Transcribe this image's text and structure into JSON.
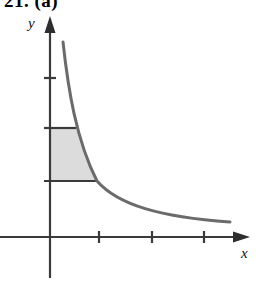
{
  "figure": {
    "caption": "21. (a)",
    "background_color": "#ffffff",
    "width": 256,
    "height": 300
  },
  "axes": {
    "x_label": "x",
    "y_label": "y",
    "axis_color": "#3a3a3a",
    "x_axis_y": 237,
    "y_axis_x": 50,
    "x_axis_start_x": 0,
    "x_axis_arrow_tip_x": 250,
    "y_axis_arrow_tip_y": 16,
    "y_axis_bottom_y": 278,
    "x_label_pos": {
      "x": 241,
      "y": 258
    },
    "y_label_pos": {
      "x": 28,
      "y": 28
    },
    "x_ticks": [
      99,
      152,
      204
    ],
    "y_ticks": [
      78,
      128,
      181
    ],
    "tick_half_length": 6
  },
  "curve": {
    "name": "reciprocal-curve",
    "color": "#6b6b6b",
    "stroke_width": 3,
    "path": "M 63 42 C 68 88, 76 140, 97 181 C 118 205, 160 217, 230 222"
  },
  "shaded_region": {
    "name": "shaded-area",
    "fill_color": "#dcdcdc",
    "edge_color": "#3a3a3a",
    "top_y": 128,
    "bottom_y": 181,
    "left_x": 50,
    "right_x_top": 76,
    "right_x_bottom": 97,
    "path": "M 50 128 L 76 128 C 80 144, 86 165, 97 181 L 50 181 Z",
    "top_edge_path": "M 44 128 L 76 128",
    "bottom_edge_path": "M 44 181 L 97 181"
  },
  "chart_data": {
    "type": "line",
    "title": "21. (a)",
    "xlabel": "x",
    "ylabel": "y",
    "grid": false,
    "legend": null,
    "series": [
      {
        "name": "y = 1/x",
        "x": [
          0.5,
          0.75,
          1.0,
          1.5,
          2.0,
          2.5,
          3.0,
          3.5,
          4.0
        ],
        "y": [
          4.0,
          2.67,
          2.0,
          1.33,
          1.0,
          0.8,
          0.67,
          0.57,
          0.5
        ]
      }
    ],
    "annotations": [
      {
        "type": "shaded-region",
        "label": "area under curve",
        "x_range": [
          0,
          1
        ],
        "y_range": [
          1,
          2
        ],
        "fill": "#dcdcdc"
      }
    ],
    "xlim": [
      0,
      4.3
    ],
    "ylim": [
      0,
      4.6
    ],
    "x_tick_values": [
      1,
      2,
      3
    ],
    "y_tick_values": [
      1,
      2,
      3
    ]
  }
}
